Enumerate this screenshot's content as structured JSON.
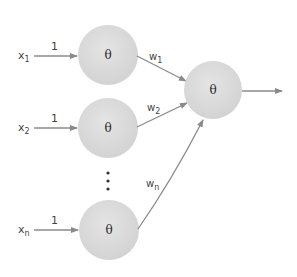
{
  "diagram": {
    "type": "neural-network-perceptron",
    "colors": {
      "node_fill": "#dcdcdc",
      "edge": "#8a8a8a",
      "text": "#444444"
    },
    "inputs": [
      {
        "base": "x",
        "sub": "1",
        "edge_label": "1",
        "node_label": "θ"
      },
      {
        "base": "x",
        "sub": "2",
        "edge_label": "1",
        "node_label": "θ"
      },
      {
        "base": "x",
        "sub": "n",
        "edge_label": "1",
        "node_label": "θ"
      }
    ],
    "weights": [
      {
        "base": "w",
        "sub": "1"
      },
      {
        "base": "w",
        "sub": "2"
      },
      {
        "base": "w",
        "sub": "n"
      }
    ],
    "ellipsis": "⋮",
    "output_node": {
      "label": "θ"
    }
  }
}
